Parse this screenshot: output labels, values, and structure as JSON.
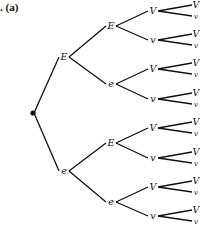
{
  "figure": {
    "caption_prefix": ".",
    "caption": "(a)"
  },
  "tree": {
    "root": {
      "x": 33,
      "y": 113
    },
    "edge_color": "#111111",
    "nodes": [
      {
        "id": "L1-E",
        "label": "E",
        "x": 64,
        "y": 57,
        "parent": "root"
      },
      {
        "id": "L1-e",
        "label": "e",
        "x": 64,
        "y": 171,
        "parent": "root"
      },
      {
        "id": "L2-EE",
        "label": "E",
        "x": 111,
        "y": 26,
        "parent": "L1-E"
      },
      {
        "id": "L2-Ee",
        "label": "e",
        "x": 111,
        "y": 84,
        "parent": "L1-E"
      },
      {
        "id": "L2-eE",
        "label": "E",
        "x": 111,
        "y": 143,
        "parent": "L1-e"
      },
      {
        "id": "L2-ee",
        "label": "e",
        "x": 111,
        "y": 202,
        "parent": "L1-e"
      },
      {
        "id": "L3-1",
        "label": "V",
        "x": 153,
        "y": 11,
        "parent": "L2-EE"
      },
      {
        "id": "L3-2",
        "label": "v",
        "x": 153,
        "y": 40,
        "parent": "L2-EE"
      },
      {
        "id": "L3-3",
        "label": "V",
        "x": 153,
        "y": 69,
        "parent": "L2-Ee"
      },
      {
        "id": "L3-4",
        "label": "v",
        "x": 153,
        "y": 99,
        "parent": "L2-Ee"
      },
      {
        "id": "L3-5",
        "label": "V",
        "x": 153,
        "y": 128,
        "parent": "L2-eE"
      },
      {
        "id": "L3-6",
        "label": "v",
        "x": 153,
        "y": 158,
        "parent": "L2-eE"
      },
      {
        "id": "L3-7",
        "label": "V",
        "x": 153,
        "y": 187,
        "parent": "L2-ee"
      },
      {
        "id": "L3-8",
        "label": "v",
        "x": 153,
        "y": 216,
        "parent": "L2-ee"
      }
    ],
    "leaf_labels": [
      "V",
      "v"
    ],
    "leaf_x": 196,
    "leaf_offset": 5
  }
}
